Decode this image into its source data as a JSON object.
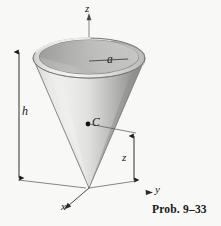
{
  "figure": {
    "caption": "Prob. 9–33",
    "background_color": "#f8f8f6",
    "ink_color": "#1b1b1b",
    "labels": {
      "axis_z": "z",
      "axis_y": "y",
      "axis_x": "x",
      "radius": "a",
      "height": "h",
      "centroid": "C",
      "centroid_height": "z"
    },
    "shading": {
      "cone_light": "#e6e6e4",
      "cone_mid": "#c9c9c7",
      "cone_dark": "#949492",
      "rim_top": "#d8d8d6",
      "rim_inner": "#b4b4b2",
      "interior_dark": "#a8a8a6",
      "outline": "#6a6a68"
    },
    "geometry": {
      "apex_x": 89,
      "apex_y": 188,
      "rim_center_x": 89,
      "rim_center_y": 58,
      "rim_radius_x": 56,
      "rim_radius_y": 20,
      "height_px": 130
    }
  }
}
